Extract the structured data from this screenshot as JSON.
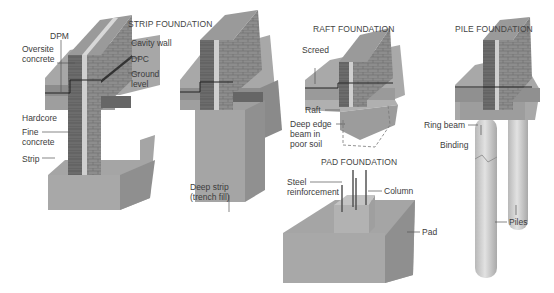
{
  "diagrams": {
    "strip": {
      "title": "STRIP FOUNDATION",
      "labels": {
        "dpm": "DPM",
        "oversite_1": "Oversite",
        "oversite_2": "concrete",
        "cavity_wall": "Cavity wall",
        "dpc": "DPC",
        "ground_1": "Ground",
        "ground_2": "level",
        "hardcore": "Hardcore",
        "fine_1": "Fine",
        "fine_2": "concrete",
        "strip": "Strip"
      }
    },
    "deep_strip": {
      "labels": {
        "line1": "Deep strip",
        "line2": "(trench fill)"
      }
    },
    "raft": {
      "title": "RAFT FOUNDATION",
      "labels": {
        "screed": "Screed",
        "raft": "Raft",
        "deep_1": "Deep edge",
        "deep_2": "beam in",
        "deep_3": "poor soil"
      }
    },
    "pad": {
      "title": "PAD FOUNDATION",
      "labels": {
        "steel_1": "Steel",
        "steel_2": "reinforcement",
        "column": "Column",
        "pad": "Pad"
      }
    },
    "pile": {
      "title": "PILE FOUNDATION",
      "labels": {
        "ring_beam": "Ring beam",
        "binding": "Binding",
        "piles": "Piles"
      }
    }
  },
  "colors": {
    "brick_face": "#8a8a8a",
    "brick_dark": "#5e5e5e",
    "ground_top": "#a9a9a9",
    "ground_side": "#7d7d7d",
    "concrete": "#b5b5b5",
    "concrete_side": "#9b9b9b",
    "line": "#333333"
  }
}
